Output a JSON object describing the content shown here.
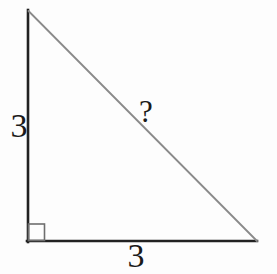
{
  "figure": {
    "labels": {
      "left_side": "3",
      "bottom_side": "3",
      "hypotenuse": "?"
    },
    "colors": {
      "background": "#fdfdfd",
      "leg_stroke": "#222222",
      "hypotenuse_stroke": "#8a8a8a",
      "right_angle_stroke": "#6e6e6e",
      "label_text": "#1a1a1a"
    }
  }
}
